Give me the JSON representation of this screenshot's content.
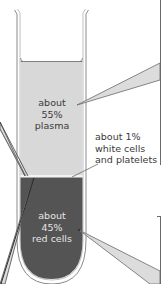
{
  "diagram": {
    "layers": [
      {
        "id": "plasma",
        "lines": [
          "about",
          "55%",
          "plasma"
        ],
        "percent": 55,
        "color": "#d8d8d8"
      },
      {
        "id": "buffy",
        "lines": [
          "about 1%",
          "white cells",
          "and platelets"
        ],
        "percent": 1,
        "color": "#f0f0f0"
      },
      {
        "id": "red",
        "lines": [
          "about",
          "45%",
          "red cells"
        ],
        "percent": 45,
        "color": "#545454"
      }
    ],
    "colors": {
      "tube_outline": "#8a8a8a",
      "callout_fill": "#dcdcdc",
      "callout_stroke": "#6a6a6a",
      "plasma_text": "#3a3a3a",
      "red_text": "#e6e6e6"
    }
  }
}
